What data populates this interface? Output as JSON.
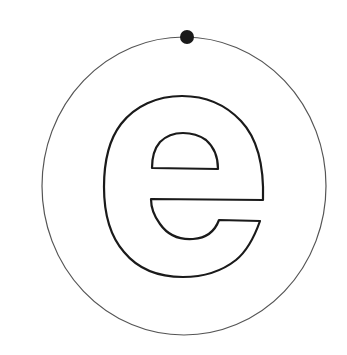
{
  "diagram": {
    "title": "Letter e within a circle with a point on the circumference",
    "letter": "e",
    "colors": {
      "background": "#ffffff",
      "circle_stroke": "#555555",
      "letter_stroke": "#1a1a1a",
      "dot_fill": "#1a1a1a"
    },
    "circle": {
      "cx": 184,
      "cy": 186,
      "rx": 142,
      "ry": 149
    },
    "dot": {
      "cx": 187,
      "cy": 37,
      "r": 7
    }
  }
}
